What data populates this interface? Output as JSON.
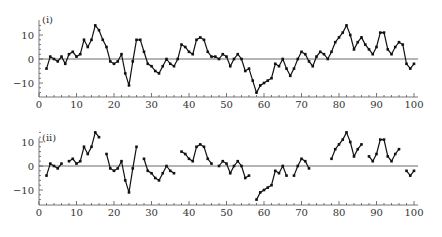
{
  "chart_data": [
    {
      "type": "line",
      "title": "(i)",
      "xlabel": "",
      "ylabel": "",
      "xlim": [
        0,
        100
      ],
      "ylim": [
        -15,
        15
      ],
      "xticks": [
        0,
        10,
        20,
        30,
        40,
        50,
        60,
        70,
        80,
        90,
        100
      ],
      "yticks": [
        -10,
        0,
        10
      ],
      "grid": false,
      "reference_line": 0,
      "x": [
        2,
        3,
        4,
        5,
        6,
        7,
        8,
        9,
        10,
        11,
        12,
        13,
        14,
        15,
        16,
        17,
        18,
        19,
        20,
        21,
        22,
        23,
        24,
        25,
        26,
        27,
        28,
        29,
        30,
        31,
        32,
        33,
        34,
        35,
        36,
        37,
        38,
        39,
        40,
        41,
        42,
        43,
        44,
        45,
        46,
        47,
        48,
        49,
        50,
        51,
        52,
        53,
        54,
        55,
        56,
        57,
        58,
        59,
        60,
        61,
        62,
        63,
        64,
        65,
        66,
        67,
        68,
        69,
        70,
        71,
        72,
        73,
        74,
        75,
        76,
        77,
        78,
        79,
        80,
        81,
        82,
        83,
        84,
        85,
        86,
        87,
        88,
        89,
        90,
        91,
        92,
        93,
        94,
        95,
        96,
        97,
        98,
        99,
        100
      ],
      "values": [
        -4,
        1,
        0,
        -1,
        1,
        -2,
        2,
        3,
        1,
        2,
        8,
        5,
        8,
        14,
        12,
        8,
        5,
        -1,
        -2,
        -1,
        2,
        -6,
        -11,
        -1,
        8,
        8,
        3,
        -2,
        -3,
        -5,
        -6,
        -3,
        0,
        -2,
        -3,
        0,
        6,
        5,
        3,
        2,
        8,
        9,
        8,
        3,
        1,
        1,
        0,
        2,
        1,
        -3,
        0,
        2,
        0,
        -5,
        -4,
        -9,
        -14,
        -11,
        -10,
        -9,
        -8,
        -2,
        -3,
        0,
        -4,
        -7,
        -4,
        0,
        3,
        2,
        -1,
        -3,
        1,
        3,
        2,
        0,
        3,
        7,
        9,
        11,
        14,
        10,
        4,
        7,
        9,
        6,
        4,
        2,
        5,
        11,
        11,
        4,
        2,
        5,
        7,
        6,
        -2,
        -4,
        -2
      ]
    },
    {
      "type": "line",
      "title": "(ii)",
      "xlabel": "",
      "ylabel": "",
      "xlim": [
        0,
        100
      ],
      "ylim": [
        -15,
        15
      ],
      "xticks": [
        0,
        10,
        20,
        30,
        40,
        50,
        60,
        70,
        80,
        90,
        100
      ],
      "yticks": [
        -10,
        0,
        10
      ],
      "grid": false,
      "reference_line": 0,
      "note": "same series as (i) with segments broken (gaps at x=7,17,27,37,47,57,67,73-77,87,97)",
      "segments": [
        {
          "x": [
            2,
            3,
            4,
            5,
            6
          ],
          "values": [
            -4,
            1,
            0,
            -1,
            1
          ]
        },
        {
          "x": [
            8,
            9,
            10,
            11,
            12,
            13,
            14,
            15,
            16
          ],
          "values": [
            2,
            3,
            1,
            2,
            8,
            5,
            8,
            14,
            12
          ]
        },
        {
          "x": [
            18,
            19,
            20,
            21,
            22,
            23,
            24,
            25,
            26
          ],
          "values": [
            5,
            -1,
            -2,
            -1,
            2,
            -6,
            -11,
            -1,
            8
          ]
        },
        {
          "x": [
            28,
            29,
            30,
            31,
            32,
            33,
            34,
            35,
            36
          ],
          "values": [
            3,
            -2,
            -3,
            -5,
            -6,
            -3,
            0,
            -2,
            -3
          ]
        },
        {
          "x": [
            38,
            39,
            40,
            41,
            42,
            43,
            44,
            45,
            46
          ],
          "values": [
            6,
            5,
            3,
            2,
            8,
            9,
            8,
            3,
            1
          ]
        },
        {
          "x": [
            48,
            49,
            50,
            51,
            52,
            53,
            54,
            55,
            56
          ],
          "values": [
            0,
            2,
            1,
            -3,
            0,
            2,
            0,
            -5,
            -4
          ]
        },
        {
          "x": [
            58,
            59,
            60,
            61,
            62,
            63,
            64,
            65,
            66
          ],
          "values": [
            -14,
            -11,
            -10,
            -9,
            -8,
            -2,
            -3,
            0,
            -4
          ]
        },
        {
          "x": [
            68,
            69,
            70,
            71,
            72
          ],
          "values": [
            -4,
            0,
            3,
            2,
            -1
          ]
        },
        {
          "x": [
            78,
            79,
            80,
            81,
            82,
            83,
            84,
            85,
            86
          ],
          "values": [
            3,
            7,
            9,
            11,
            14,
            10,
            4,
            7,
            9
          ]
        },
        {
          "x": [
            88,
            89,
            90,
            91,
            92,
            93,
            94,
            95,
            96
          ],
          "values": [
            4,
            2,
            5,
            11,
            11,
            4,
            2,
            5,
            7
          ]
        },
        {
          "x": [
            98,
            99,
            100
          ],
          "values": [
            -2,
            -4,
            -2
          ]
        }
      ]
    }
  ]
}
